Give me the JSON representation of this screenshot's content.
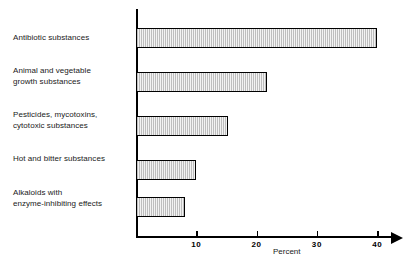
{
  "chart_data": {
    "type": "bar",
    "orientation": "horizontal",
    "title": "",
    "xlabel": "Percent",
    "ylabel": "",
    "categories": [
      "Antibiotic substances",
      "Animal and vegetable\ngrowth substances",
      "Pesticides, mycotoxins,\ncytotoxic substances",
      "Hot and bitter substances",
      "Alkaloids with\nenzyme-inhibiting effects"
    ],
    "values": [
      40,
      21.8,
      15.2,
      10,
      8.1
    ],
    "xlim": [
      0,
      44
    ],
    "xticks": [
      10,
      20,
      30,
      40
    ],
    "xtick_labels": [
      "10",
      "20",
      "30",
      "40"
    ],
    "grid": false,
    "legend": null,
    "bar_fill": "#ededed",
    "bar_hatch_color": "#bdbdbd",
    "bar_edge": "#000000",
    "axis_color": "#000000"
  },
  "axis": {
    "title": "Percent"
  }
}
